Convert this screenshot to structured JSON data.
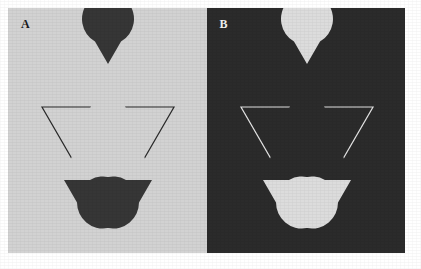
{
  "figure": {
    "width": 421,
    "height": 269,
    "background_color": "#ffffff",
    "margin": 8,
    "caption": ""
  },
  "panels": [
    {
      "id": "A",
      "label": "A",
      "position": "left",
      "background_color": "#d2d2d2",
      "inducer_color": "#363636",
      "line_color": "#2a2a2a",
      "label_color": "#1a1a1a",
      "polarity": "dark-inducers-on-light-field",
      "geometry": {
        "width": 199,
        "height": 245,
        "inducers": [
          {
            "name": "top-inducer",
            "cx": 100,
            "cy": 56,
            "r": 26,
            "notch_direction_deg": 90,
            "notch_angle_deg": 60
          },
          {
            "name": "bottom-left-inducer",
            "cx": 56,
            "cy": 172,
            "r": 26,
            "notch_direction_deg": 330,
            "notch_angle_deg": 60
          },
          {
            "name": "bottom-right-inducer",
            "cx": 144,
            "cy": 172,
            "r": 26,
            "notch_direction_deg": 210,
            "notch_angle_deg": 60
          }
        ],
        "outline_triangle": {
          "name": "inverted-outline-triangle",
          "orientation": "point-down",
          "vertices": [
            [
              34,
              99
            ],
            [
              166,
              99
            ],
            [
              100,
              213
            ]
          ],
          "stroke_width": 1.2,
          "occluded_by_illusory_triangle": true
        },
        "illusory_triangle": {
          "name": "illusory-triangle",
          "orientation": "point-up",
          "vertices": [
            [
              100,
              56
            ],
            [
              56,
              172
            ],
            [
              144,
              172
            ]
          ],
          "visible": false
        }
      }
    },
    {
      "id": "B",
      "label": "B",
      "position": "right",
      "background_color": "#2b2b2b",
      "inducer_color": "#dcdcdc",
      "line_color": "#e4e4e4",
      "label_color": "#f0f0f0",
      "polarity": "light-inducers-on-dark-field",
      "geometry": {
        "width": 199,
        "height": 245,
        "inducers": [
          {
            "name": "top-inducer",
            "cx": 100,
            "cy": 56,
            "r": 26,
            "notch_direction_deg": 90,
            "notch_angle_deg": 60
          },
          {
            "name": "bottom-left-inducer",
            "cx": 56,
            "cy": 172,
            "r": 26,
            "notch_direction_deg": 330,
            "notch_angle_deg": 60
          },
          {
            "name": "bottom-right-inducer",
            "cx": 144,
            "cy": 172,
            "r": 26,
            "notch_direction_deg": 210,
            "notch_angle_deg": 60
          }
        ],
        "outline_triangle": {
          "name": "inverted-outline-triangle",
          "orientation": "point-down",
          "vertices": [
            [
              34,
              99
            ],
            [
              166,
              99
            ],
            [
              100,
              213
            ]
          ],
          "stroke_width": 1.2,
          "occluded_by_illusory_triangle": true
        },
        "illusory_triangle": {
          "name": "illusory-triangle",
          "orientation": "point-up",
          "vertices": [
            [
              100,
              56
            ],
            [
              56,
              172
            ],
            [
              144,
              172
            ]
          ],
          "visible": false
        }
      }
    }
  ]
}
